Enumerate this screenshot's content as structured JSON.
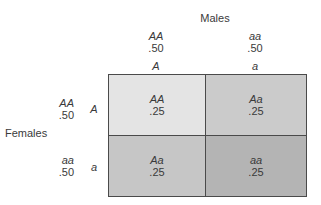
{
  "males": {
    "title": "Males",
    "columns": [
      {
        "genotype": "AA",
        "frequency": ".50",
        "allele": "A"
      },
      {
        "genotype": "aa",
        "frequency": ".50",
        "allele": "a"
      }
    ]
  },
  "females": {
    "title": "Females",
    "rows": [
      {
        "genotype": "AA",
        "frequency": ".50",
        "allele": "A"
      },
      {
        "genotype": "aa",
        "frequency": ".50",
        "allele": "a"
      }
    ]
  },
  "grid": {
    "cells": [
      [
        {
          "genotype": "AA",
          "frequency": ".25",
          "color": "#e4e4e4"
        },
        {
          "genotype": "Aa",
          "frequency": ".25",
          "color": "#cbcbcb"
        }
      ],
      [
        {
          "genotype": "Aa",
          "frequency": ".25",
          "color": "#c6c6c6"
        },
        {
          "genotype": "aa",
          "frequency": ".25",
          "color": "#b4b4b4"
        }
      ]
    ],
    "border_color": "#4a4a4a"
  }
}
